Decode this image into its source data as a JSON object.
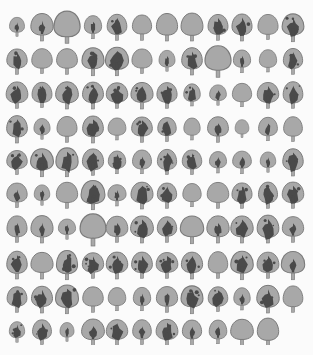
{
  "figure": {
    "colors": {
      "background": "#fbfbfb",
      "leaf": "#a8a8a8",
      "outline": "#7a7a7a",
      "variegation": "#4a4a4a"
    },
    "rows": [
      {
        "y": 30,
        "leaves": [
          [
            1,
            0.7
          ],
          [
            2,
            1
          ],
          [
            0,
            1.15
          ],
          [
            2,
            0.85
          ],
          [
            3,
            0.95
          ],
          [
            0,
            0.95
          ],
          [
            0,
            1
          ],
          [
            0,
            1
          ],
          [
            3,
            0.95
          ],
          [
            3,
            1
          ],
          [
            0,
            0.9
          ],
          [
            3,
            1.05
          ]
        ]
      },
      {
        "y": 64,
        "leaves": [
          [
            3,
            0.95
          ],
          [
            0,
            0.9
          ],
          [
            0,
            0.95
          ],
          [
            3,
            1.05
          ],
          [
            3,
            1.05
          ],
          [
            0,
            0.9
          ],
          [
            2,
            0.75
          ],
          [
            3,
            1
          ],
          [
            0,
            1.15
          ],
          [
            2,
            0.85
          ],
          [
            0,
            0.8
          ],
          [
            3,
            0.95
          ]
        ]
      },
      {
        "y": 98,
        "leaves": [
          [
            3,
            0.95
          ],
          [
            3,
            0.9
          ],
          [
            3,
            1
          ],
          [
            3,
            1
          ],
          [
            3,
            0.95
          ],
          [
            3,
            1
          ],
          [
            3,
            0.95
          ],
          [
            3,
            0.8
          ],
          [
            2,
            0.75
          ],
          [
            0,
            0.85
          ],
          [
            3,
            0.95
          ],
          [
            3,
            0.95
          ]
        ]
      },
      {
        "y": 132,
        "leaves": [
          [
            3,
            1
          ],
          [
            2,
            0.75
          ],
          [
            0,
            0.95
          ],
          [
            3,
            1
          ],
          [
            0,
            0.8
          ],
          [
            3,
            0.95
          ],
          [
            3,
            0.9
          ],
          [
            0,
            0.8
          ],
          [
            2,
            0.95
          ],
          [
            0,
            0.65
          ],
          [
            2,
            0.85
          ],
          [
            0,
            0.9
          ]
        ]
      },
      {
        "y": 165,
        "leaves": [
          [
            3,
            0.9
          ],
          [
            3,
            1.05
          ],
          [
            3,
            1.05
          ],
          [
            3,
            0.95
          ],
          [
            3,
            0.85
          ],
          [
            2,
            0.85
          ],
          [
            3,
            0.9
          ],
          [
            3,
            0.9
          ],
          [
            2,
            0.8
          ],
          [
            2,
            0.85
          ],
          [
            2,
            0.75
          ],
          [
            3,
            1
          ]
        ]
      },
      {
        "y": 198,
        "leaves": [
          [
            2,
            0.9
          ],
          [
            2,
            0.75
          ],
          [
            0,
            0.95
          ],
          [
            3,
            1.05
          ],
          [
            2,
            0.8
          ],
          [
            3,
            1
          ],
          [
            3,
            0.95
          ],
          [
            0,
            0.85
          ],
          [
            0,
            0.95
          ],
          [
            3,
            0.95
          ],
          [
            3,
            0.95
          ],
          [
            3,
            0.95
          ]
        ]
      },
      {
        "y": 232,
        "leaves": [
          [
            2,
            0.95
          ],
          [
            2,
            1
          ],
          [
            2,
            0.75
          ],
          [
            0,
            1.2
          ],
          [
            2,
            0.95
          ],
          [
            3,
            1
          ],
          [
            3,
            0.95
          ],
          [
            0,
            1.05
          ],
          [
            2,
            1
          ],
          [
            3,
            1
          ],
          [
            3,
            1
          ],
          [
            2,
            0.95
          ]
        ]
      },
      {
        "y": 268,
        "leaves": [
          [
            3,
            1
          ],
          [
            0,
            1
          ],
          [
            3,
            1.05
          ],
          [
            3,
            0.95
          ],
          [
            3,
            1
          ],
          [
            3,
            0.95
          ],
          [
            3,
            0.95
          ],
          [
            3,
            1
          ],
          [
            0,
            0.95
          ],
          [
            3,
            1.05
          ],
          [
            3,
            0.95
          ],
          [
            2,
            1.05
          ]
        ]
      },
      {
        "y": 302,
        "leaves": [
          [
            3,
            0.95
          ],
          [
            3,
            1
          ],
          [
            3,
            1.05
          ],
          [
            0,
            0.95
          ],
          [
            0,
            0.85
          ],
          [
            2,
            0.85
          ],
          [
            2,
            0.95
          ],
          [
            3,
            1.05
          ],
          [
            3,
            0.9
          ],
          [
            2,
            0.8
          ],
          [
            3,
            1
          ],
          [
            0,
            0.95
          ]
        ]
      },
      {
        "y": 335,
        "leaves": [
          [
            3,
            0.75
          ],
          [
            3,
            0.9
          ],
          [
            2,
            0.7
          ],
          [
            2,
            1
          ],
          [
            3,
            0.95
          ],
          [
            2,
            0.9
          ],
          [
            3,
            0.95
          ],
          [
            2,
            0.95
          ],
          [
            2,
            0.85
          ],
          [
            0,
            1
          ],
          [
            0,
            1
          ]
        ]
      }
    ],
    "columns_x": [
      17,
      42,
      67,
      93,
      117,
      142,
      167,
      192,
      218,
      242,
      268,
      293
    ]
  }
}
